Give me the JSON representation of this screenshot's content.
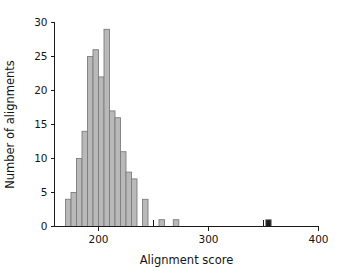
{
  "figure": {
    "background_color": "#ffffff",
    "bar_fill_color": "#b9b9b9",
    "bar_edge_color": "#7d7d7d",
    "highlight_bar_color": "#1c1c1c",
    "axis_color": "#1a1a1a"
  },
  "chart_data": {
    "type": "bar",
    "title": "",
    "subtitle": "",
    "xlabel": "Alignment score",
    "ylabel": "Number of alignments",
    "xlim": [
      160,
      400
    ],
    "ylim": [
      0,
      30
    ],
    "grid": false,
    "legend": null,
    "bin_width": 5,
    "x_ticks": [
      200,
      300,
      400
    ],
    "x_tick_labels": [
      "200",
      "300",
      "400"
    ],
    "x_minor_ticks": [
      250,
      350
    ],
    "y_ticks": [
      0,
      5,
      10,
      15,
      20,
      25,
      30
    ],
    "y_tick_labels": [
      "0",
      "5",
      "10",
      "15",
      "20",
      "25",
      "30"
    ],
    "bins": [
      {
        "x": 170,
        "value": 4,
        "highlight": false
      },
      {
        "x": 175,
        "value": 5,
        "highlight": false
      },
      {
        "x": 180,
        "value": 10,
        "highlight": false
      },
      {
        "x": 185,
        "value": 14,
        "highlight": false
      },
      {
        "x": 190,
        "value": 25,
        "highlight": false
      },
      {
        "x": 195,
        "value": 26,
        "highlight": false
      },
      {
        "x": 200,
        "value": 22,
        "highlight": false
      },
      {
        "x": 205,
        "value": 29,
        "highlight": false
      },
      {
        "x": 210,
        "value": 17,
        "highlight": false
      },
      {
        "x": 215,
        "value": 16,
        "highlight": false
      },
      {
        "x": 220,
        "value": 11,
        "highlight": false
      },
      {
        "x": 225,
        "value": 8,
        "highlight": false
      },
      {
        "x": 230,
        "value": 7,
        "highlight": false
      },
      {
        "x": 240,
        "value": 4,
        "highlight": false
      },
      {
        "x": 255,
        "value": 1,
        "highlight": false
      },
      {
        "x": 268,
        "value": 1,
        "highlight": false
      },
      {
        "x": 352,
        "value": 1,
        "highlight": true
      }
    ],
    "annotations": [
      {
        "text": "highlighted outlier alignment",
        "x": 352,
        "y": 1
      }
    ]
  }
}
